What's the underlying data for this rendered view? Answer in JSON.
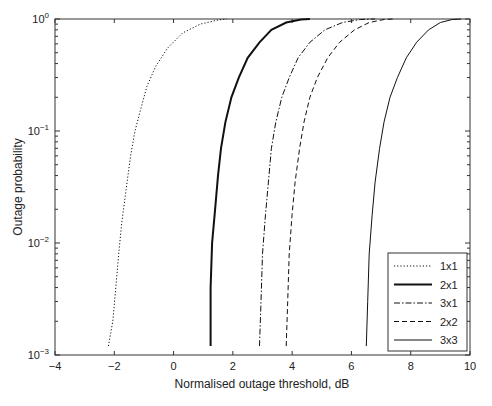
{
  "chart_data": {
    "type": "line",
    "title": "",
    "xlabel": "Normalised outage threshold, dB",
    "ylabel": "Outage probability",
    "xlim": [
      -4,
      10
    ],
    "ylim": [
      0.001,
      1
    ],
    "yscale": "log",
    "grid": false,
    "legend_position": "lower right",
    "xticks": [
      "-4",
      "-2",
      "0",
      "2",
      "4",
      "6",
      "8",
      "10"
    ],
    "yticks": [
      "10^-3",
      "10^-2",
      "10^-1",
      "10^0"
    ],
    "series": [
      {
        "name": "1x1",
        "style": "dotted",
        "width": 1,
        "x": [
          -2.2,
          -2.05,
          -1.95,
          -1.85,
          -1.75,
          -1.6,
          -1.45,
          -1.3,
          -1.1,
          -0.9,
          -0.6,
          -0.2,
          0.3,
          0.9,
          1.5,
          1.8
        ],
        "y": [
          0.0012,
          0.002,
          0.004,
          0.008,
          0.015,
          0.03,
          0.06,
          0.1,
          0.16,
          0.25,
          0.38,
          0.55,
          0.75,
          0.9,
          0.98,
          1.0
        ]
      },
      {
        "name": "2x1",
        "style": "solid-bold",
        "width": 2,
        "x": [
          1.25,
          1.25,
          1.3,
          1.4,
          1.5,
          1.6,
          1.75,
          1.95,
          2.2,
          2.5,
          2.9,
          3.3,
          3.8,
          4.3,
          4.6
        ],
        "y": [
          0.0012,
          0.004,
          0.01,
          0.02,
          0.04,
          0.07,
          0.12,
          0.2,
          0.3,
          0.45,
          0.62,
          0.8,
          0.93,
          0.99,
          1.0
        ]
      },
      {
        "name": "3x1",
        "style": "dashdot",
        "width": 1,
        "x": [
          2.9,
          2.95,
          3.0,
          3.1,
          3.2,
          3.3,
          3.45,
          3.65,
          3.9,
          4.2,
          4.6,
          5.1,
          5.7,
          6.3,
          6.8
        ],
        "y": [
          0.0012,
          0.003,
          0.008,
          0.018,
          0.035,
          0.07,
          0.12,
          0.2,
          0.3,
          0.45,
          0.62,
          0.8,
          0.93,
          0.99,
          1.0
        ]
      },
      {
        "name": "2x2",
        "style": "dashed",
        "width": 1,
        "x": [
          3.8,
          3.85,
          3.9,
          4.0,
          4.1,
          4.25,
          4.4,
          4.6,
          4.85,
          5.2,
          5.6,
          6.1,
          6.6,
          7.1,
          7.4
        ],
        "y": [
          0.0012,
          0.003,
          0.008,
          0.018,
          0.035,
          0.07,
          0.12,
          0.2,
          0.3,
          0.45,
          0.62,
          0.8,
          0.93,
          0.99,
          1.0
        ]
      },
      {
        "name": "3x3",
        "style": "solid",
        "width": 1,
        "x": [
          6.5,
          6.55,
          6.6,
          6.7,
          6.8,
          6.95,
          7.1,
          7.3,
          7.55,
          7.85,
          8.2,
          8.6,
          9.0,
          9.4,
          9.7
        ],
        "y": [
          0.0012,
          0.003,
          0.008,
          0.018,
          0.035,
          0.07,
          0.12,
          0.2,
          0.3,
          0.45,
          0.62,
          0.8,
          0.93,
          0.99,
          1.0
        ]
      }
    ]
  }
}
